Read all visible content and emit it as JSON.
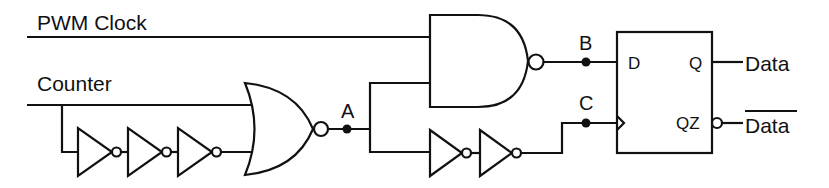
{
  "diagram": {
    "type": "logic-circuit",
    "inputs": {
      "pwm_clock": "PWM Clock",
      "counter": "Counter"
    },
    "nodes": {
      "a": "A",
      "b": "B",
      "c": "C"
    },
    "flip_flop": {
      "d_pin": "D",
      "q_pin": "Q",
      "qz_pin": "QZ"
    },
    "outputs": {
      "data": "Data",
      "data_bar": "Data"
    },
    "colors": {
      "stroke": "#111111",
      "background": "#ffffff"
    }
  }
}
